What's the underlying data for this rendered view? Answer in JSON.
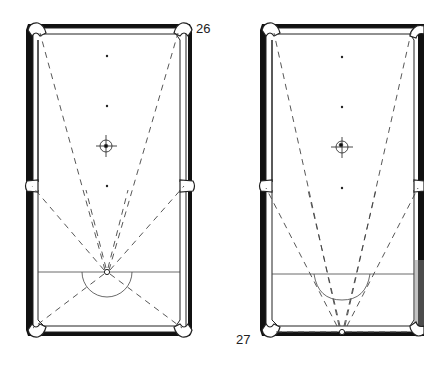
{
  "figures": [
    {
      "id": "26",
      "label": "26",
      "description": "Pool table diagram: cue ball on head string, dashed lines to all six pockets",
      "spots": [
        "foot-spot",
        "center-spot-upper",
        "target-ring",
        "center-spot"
      ],
      "cue_ball_position": "head-string-center",
      "aim_lines_to": [
        "top-left-pocket",
        "top-right-pocket",
        "middle-left-pocket",
        "middle-right-pocket",
        "bottom-left-pocket",
        "bottom-right-pocket"
      ]
    },
    {
      "id": "27",
      "label": "27",
      "description": "Pool table diagram: cue ball on bottom rail, dashed lines to top pockets, middle pockets and along rail",
      "spots": [
        "foot-spot",
        "center-spot-upper",
        "target-ring",
        "center-spot"
      ],
      "cue_ball_position": "bottom-rail-center",
      "aim_lines_to": [
        "top-left-pocket",
        "top-right-pocket",
        "middle-left-pocket",
        "middle-right-pocket",
        "inner-left",
        "inner-right"
      ]
    }
  ],
  "colors": {
    "rail": "#111111",
    "cushion": "#ffffff",
    "line": "#333333",
    "background": "#ffffff"
  }
}
